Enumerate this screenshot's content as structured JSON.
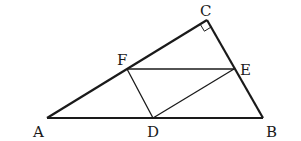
{
  "figure": {
    "type": "geometry",
    "stroke_color": "#1a1a1a",
    "background": "#ffffff",
    "points": {
      "A": {
        "label": "A",
        "x": 47,
        "y": 118,
        "label_x": 33,
        "label_y": 137
      },
      "B": {
        "label": "B",
        "x": 263,
        "y": 118,
        "label_x": 266,
        "label_y": 137
      },
      "C": {
        "label": "C",
        "x": 207,
        "y": 20,
        "label_x": 200,
        "label_y": 16
      },
      "D": {
        "label": "D",
        "x": 153,
        "y": 118,
        "label_x": 147,
        "label_y": 137
      },
      "E": {
        "label": "E",
        "x": 234,
        "y": 69,
        "label_x": 240,
        "label_y": 74
      },
      "F": {
        "label": "F",
        "x": 127,
        "y": 69,
        "label_x": 117,
        "label_y": 65
      }
    },
    "segments": [
      {
        "from": "A",
        "to": "B",
        "weight": "thick"
      },
      {
        "from": "A",
        "to": "C",
        "weight": "thick"
      },
      {
        "from": "C",
        "to": "B",
        "weight": "thick"
      },
      {
        "from": "F",
        "to": "E",
        "weight": "thin"
      },
      {
        "from": "F",
        "to": "D",
        "weight": "thin"
      },
      {
        "from": "D",
        "to": "E",
        "weight": "thin"
      }
    ],
    "right_angle_marker": {
      "vertex": "C"
    }
  }
}
